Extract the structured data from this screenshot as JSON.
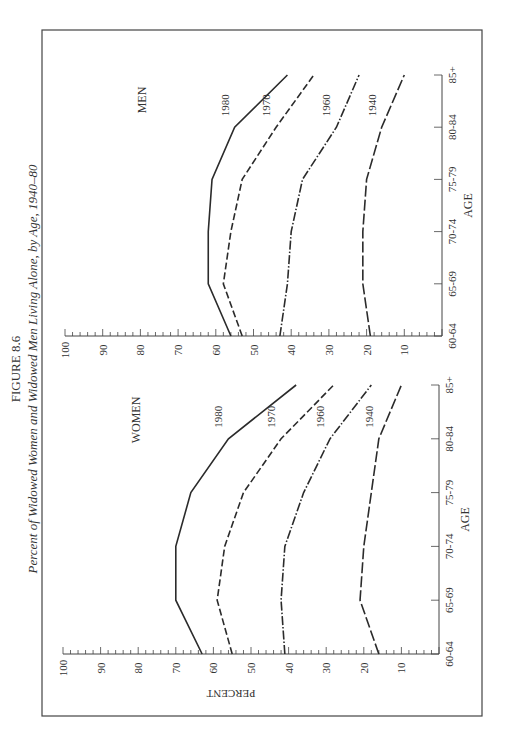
{
  "figure": {
    "label": "FIGURE 8.6",
    "title": "Percent of Widowed Women and Widowed Men Living Alone, by Age, 1940–80"
  },
  "chart_data": [
    {
      "type": "line",
      "panel": "WOMEN",
      "title": "WOMEN",
      "xlabel": "AGE",
      "ylabel": "PERCENT",
      "categories": [
        "60-64",
        "65-69",
        "70-74",
        "75-79",
        "80-84",
        "85+"
      ],
      "ylim": [
        0,
        100
      ],
      "yticks": [
        10,
        20,
        30,
        40,
        50,
        60,
        70,
        80,
        90,
        100
      ],
      "grid": false,
      "orientation": "rotated 90° counter-clockwise on page",
      "series": [
        {
          "name": "1980",
          "style": "solid",
          "values": [
            63,
            70,
            70,
            66,
            56,
            38
          ]
        },
        {
          "name": "1970",
          "style": "dashed",
          "values": [
            55,
            59,
            57,
            52,
            42,
            28
          ]
        },
        {
          "name": "1960",
          "style": "dash-dot",
          "values": [
            41,
            42,
            41,
            36,
            29,
            18
          ]
        },
        {
          "name": "1940",
          "style": "long-dash",
          "values": [
            16,
            21,
            20,
            18,
            16,
            10
          ]
        }
      ]
    },
    {
      "type": "line",
      "panel": "MEN",
      "title": "MEN",
      "xlabel": "AGE",
      "ylabel": "",
      "categories": [
        "60-64",
        "65-69",
        "70-74",
        "75-79",
        "80-84",
        "85+"
      ],
      "ylim": [
        0,
        100
      ],
      "yticks": [
        10,
        20,
        30,
        40,
        50,
        60,
        70,
        80,
        90,
        100
      ],
      "grid": false,
      "orientation": "rotated 90° counter-clockwise on page",
      "series": [
        {
          "name": "1980",
          "style": "solid",
          "values": [
            56,
            62,
            62,
            61,
            55,
            41
          ]
        },
        {
          "name": "1970",
          "style": "dashed",
          "values": [
            53,
            58,
            56,
            53,
            44,
            34
          ]
        },
        {
          "name": "1960",
          "style": "dash-dot",
          "values": [
            43,
            41,
            40,
            37,
            28,
            22
          ]
        },
        {
          "name": "1940",
          "style": "long-dash",
          "values": [
            19,
            21,
            21,
            20,
            16,
            10
          ]
        }
      ]
    }
  ]
}
